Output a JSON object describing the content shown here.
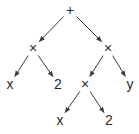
{
  "diagram": {
    "type": "expression-tree",
    "nodes": [
      {
        "id": "n0",
        "label": "+",
        "kind": "operator"
      },
      {
        "id": "n1",
        "label": "×",
        "kind": "operator"
      },
      {
        "id": "n2",
        "label": "×",
        "kind": "operator"
      },
      {
        "id": "n3",
        "label": "x",
        "kind": "operand"
      },
      {
        "id": "n4",
        "label": "2",
        "kind": "operand"
      },
      {
        "id": "n5",
        "label": "×",
        "kind": "operator"
      },
      {
        "id": "n6",
        "label": "y",
        "kind": "operand"
      },
      {
        "id": "n7",
        "label": "x",
        "kind": "operand"
      },
      {
        "id": "n8",
        "label": "2",
        "kind": "operand"
      }
    ],
    "edges": [
      {
        "from": "n0",
        "to": "n1"
      },
      {
        "from": "n0",
        "to": "n2"
      },
      {
        "from": "n1",
        "to": "n3"
      },
      {
        "from": "n1",
        "to": "n4"
      },
      {
        "from": "n2",
        "to": "n5"
      },
      {
        "from": "n2",
        "to": "n6"
      },
      {
        "from": "n5",
        "to": "n7"
      },
      {
        "from": "n5",
        "to": "n8"
      }
    ],
    "colors": {
      "stroke": "#3a3a3a",
      "text": "#2a2a2a",
      "background": "#ffffff"
    }
  }
}
